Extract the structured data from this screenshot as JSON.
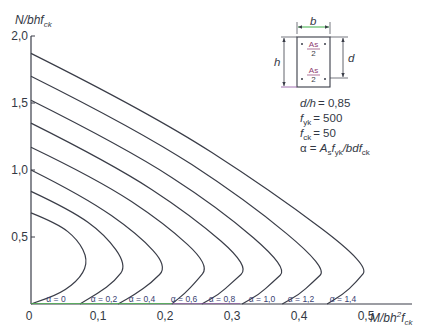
{
  "chart_data": {
    "type": "line",
    "title": "",
    "xlabel": "M/bh²f_ck",
    "ylabel": "N/bhf_ck",
    "xlim": [
      0,
      0.55
    ],
    "ylim": [
      0,
      2.0
    ],
    "x_ticks": [
      "0",
      "0,1",
      "0,2",
      "0,3",
      "0,4",
      "0,5"
    ],
    "y_ticks": [
      "0,5",
      "1,0",
      "1,5",
      "2,0"
    ],
    "grid": false,
    "legend_position": "none (inline labels on x-axis)",
    "series": [
      {
        "name": "α = 0",
        "label": "α = 0",
        "points": [
          [
            0.0,
            0.68
          ],
          [
            0.04,
            0.6
          ],
          [
            0.07,
            0.48
          ],
          [
            0.085,
            0.33
          ],
          [
            0.075,
            0.2
          ],
          [
            0.045,
            0.08
          ],
          [
            0.0,
            0.0
          ]
        ]
      },
      {
        "name": "α = 0,2",
        "label": "α = 0,2",
        "points": [
          [
            0.0,
            0.84
          ],
          [
            0.06,
            0.7
          ],
          [
            0.11,
            0.52
          ],
          [
            0.143,
            0.29
          ],
          [
            0.125,
            0.17
          ],
          [
            0.1,
            0.08
          ],
          [
            0.073,
            0.0
          ]
        ]
      },
      {
        "name": "α = 0,4",
        "label": "α = 0,4",
        "points": [
          [
            0.0,
            1.0
          ],
          [
            0.08,
            0.8
          ],
          [
            0.16,
            0.52
          ],
          [
            0.204,
            0.28
          ],
          [
            0.18,
            0.16
          ],
          [
            0.155,
            0.07
          ],
          [
            0.13,
            0.0
          ]
        ]
      },
      {
        "name": "α = 0,6",
        "label": "α = 0,6",
        "points": [
          [
            0.0,
            1.17
          ],
          [
            0.1,
            0.93
          ],
          [
            0.2,
            0.6
          ],
          [
            0.267,
            0.29
          ],
          [
            0.245,
            0.16
          ],
          [
            0.23,
            0.08
          ],
          [
            0.21,
            0.0
          ]
        ]
      },
      {
        "name": "α = 0,8",
        "label": "α = 0,8",
        "points": [
          [
            0.0,
            1.35
          ],
          [
            0.12,
            1.05
          ],
          [
            0.24,
            0.66
          ],
          [
            0.327,
            0.28
          ],
          [
            0.3,
            0.16
          ],
          [
            0.28,
            0.07
          ],
          [
            0.255,
            0.0
          ]
        ]
      },
      {
        "name": "α = 1,0",
        "label": "α = 1,0",
        "points": [
          [
            0.0,
            1.52
          ],
          [
            0.14,
            1.17
          ],
          [
            0.28,
            0.72
          ],
          [
            0.384,
            0.27
          ],
          [
            0.36,
            0.16
          ],
          [
            0.34,
            0.07
          ],
          [
            0.315,
            0.0
          ]
        ]
      },
      {
        "name": "α = 1,2",
        "label": "α = 1,2",
        "points": [
          [
            0.0,
            1.7
          ],
          [
            0.16,
            1.3
          ],
          [
            0.32,
            0.78
          ],
          [
            0.443,
            0.27
          ],
          [
            0.42,
            0.16
          ],
          [
            0.4,
            0.07
          ],
          [
            0.375,
            0.0
          ]
        ]
      },
      {
        "name": "α = 1,4",
        "label": "α = 1,4",
        "points": [
          [
            0.0,
            1.87
          ],
          [
            0.18,
            1.42
          ],
          [
            0.36,
            0.84
          ],
          [
            0.506,
            0.29
          ],
          [
            0.485,
            0.16
          ],
          [
            0.465,
            0.07
          ],
          [
            0.442,
            0.0
          ]
        ]
      }
    ],
    "annotations": [
      "d/h = 0,85",
      "f_yk = 500",
      "f_ck = 50",
      "α = A_s f_yk / bdf_ck"
    ]
  },
  "axes": {
    "y_title_main": "N/bhf",
    "y_title_sub": "ck",
    "x_title_main": "M/bh",
    "x_title_sup": "2",
    "x_title_f": "f",
    "x_title_sub": "ck",
    "origin_label": "0"
  },
  "section_diagram": {
    "b_label": "b",
    "h_label": "h",
    "d_label": "d",
    "top_bar_num": "As",
    "top_bar_den": "2",
    "bottom_bar_num": "As",
    "bottom_bar_den": "2"
  },
  "parameters": {
    "dh_label": "d/h",
    "dh_value": "= 0,85",
    "fyk_f": "f",
    "fyk_sub": "yk",
    "fyk_value": "= 500",
    "fck_f": "f",
    "fck_sub": "ck",
    "fck_value": "= 50",
    "alpha_lhs": "α = ",
    "alpha_A": "A",
    "alpha_A_sub": "s",
    "alpha_f": "f",
    "alpha_f_sub": "yk",
    "alpha_den": "/bdf",
    "alpha_den_sub": "ck"
  },
  "colors": {
    "curve": "#3a3d48",
    "axis": "#3a3d48",
    "axis_accent_green": "#4caf50",
    "axis_accent_purple": "#8a4f9e",
    "label_text": "#3a3f73",
    "dim_green": "#3fae49",
    "as_label": "#8e3b6f"
  }
}
